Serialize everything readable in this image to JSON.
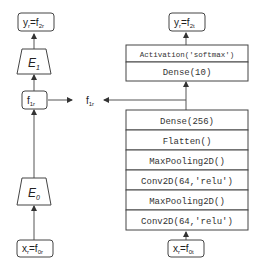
{
  "left_branch": {
    "output_box": {
      "main": "y",
      "sub1": "r",
      "eq": "=f",
      "sub2": "2r"
    },
    "encoder_top": {
      "main": "E",
      "sub": "1"
    },
    "feature_box": {
      "main": "f",
      "sub": "1r"
    },
    "encoder_bottom": {
      "main": "E",
      "sub": "0"
    },
    "input_box": {
      "main": "x",
      "sub1": "r",
      "eq": "=f",
      "sub2": "0r"
    }
  },
  "middle_label": {
    "main": "f",
    "sub": "1r"
  },
  "right_branch": {
    "output_box": {
      "main": "y",
      "sub1": "r",
      "eq": "=f",
      "sub2": "2t"
    },
    "top_stack": [
      "Activation('softmax')",
      "Dense(10)"
    ],
    "bottom_stack": [
      "Dense(256)",
      "Flatten()",
      "MaxPooling2D()",
      "Conv2D(64,'relu')",
      "MaxPooling2D()",
      "Conv2D(64,'relu')"
    ],
    "input_box": {
      "main": "x",
      "sub1": "r",
      "eq": "=f",
      "sub2": "0t"
    }
  }
}
